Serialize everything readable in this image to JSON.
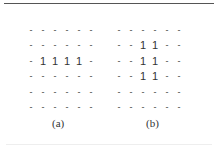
{
  "figure": {
    "panels": [
      {
        "label": "(a)",
        "grid": [
          [
            "-",
            "-",
            "-",
            "-",
            "-",
            "-"
          ],
          [
            "-",
            "-",
            "-",
            "-",
            "-",
            "-"
          ],
          [
            "-",
            "1",
            "1",
            "1",
            "1",
            "-"
          ],
          [
            "-",
            "-",
            "-",
            "-",
            "-",
            "-"
          ],
          [
            "-",
            "-",
            "-",
            "-",
            "-",
            "-"
          ],
          [
            "-",
            "-",
            "-",
            "-",
            "-",
            "-"
          ]
        ]
      },
      {
        "label": "(b)",
        "grid": [
          [
            "-",
            "-",
            "-",
            "-",
            "-",
            "-"
          ],
          [
            "-",
            "-",
            "1",
            "1",
            "-",
            "-"
          ],
          [
            "-",
            "-",
            "1",
            "1",
            "-",
            "-"
          ],
          [
            "-",
            "-",
            "1",
            "1",
            "-",
            "-"
          ],
          [
            "-",
            "-",
            "-",
            "-",
            "-",
            "-"
          ],
          [
            "-",
            "-",
            "-",
            "-",
            "-",
            "-"
          ]
        ]
      }
    ]
  }
}
